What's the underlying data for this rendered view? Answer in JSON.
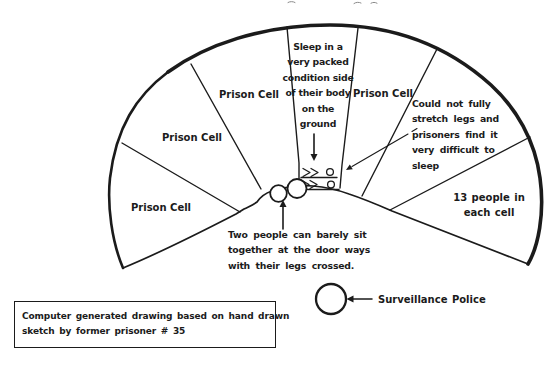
{
  "figure": {
    "colors": {
      "background": "#ffffff",
      "ink": "#1b1b1b"
    },
    "cells": {
      "prison_cell_1": "Prison Cell",
      "prison_cell_2": "Prison Cell",
      "prison_cell_3": "Prison Cell",
      "prison_cell_4": "Prison Cell",
      "sleep_note": "Sleep in a\nvery packed\ncondition side\nof their body\non the\nground",
      "stretch_note": "Could not fully\nstretch legs and\nprisoners find it\nvery difficult to\nsleep",
      "capacity_note": "13 people in\neach cell"
    },
    "doorway_note": "Two people can barely sit\ntogether at the door ways\nwith their legs crossed.",
    "surveillance_label": "Surveillance Police",
    "caption": "Computer generated drawing based on hand drawn\nsketch by former prisoner # 35"
  }
}
